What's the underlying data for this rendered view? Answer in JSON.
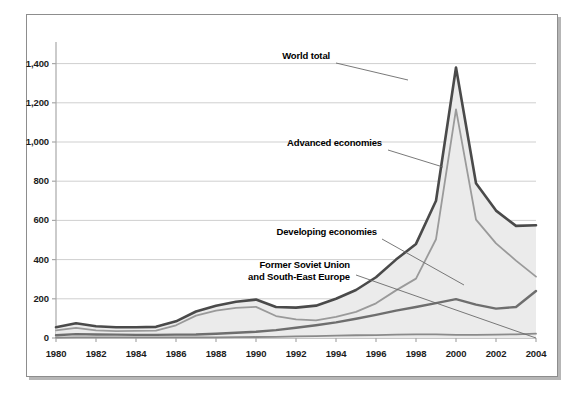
{
  "chart_data": {
    "type": "area",
    "title": "",
    "subtitle": "",
    "xlabel": "",
    "ylabel": "",
    "xlim": [
      1980,
      2004
    ],
    "ylim": [
      0,
      1500
    ],
    "grid": true,
    "legend_position": "inline-annotations",
    "x": [
      1980,
      1981,
      1982,
      1983,
      1984,
      1985,
      1986,
      1987,
      1988,
      1989,
      1990,
      1991,
      1992,
      1993,
      1994,
      1995,
      1996,
      1997,
      1998,
      1999,
      2000,
      2001,
      2002,
      2003,
      2004
    ],
    "y_ticks": [
      0,
      200,
      400,
      600,
      800,
      1000,
      1200,
      1400
    ],
    "y_tick_labels": [
      "0",
      "200",
      "400",
      "600",
      "800",
      "1,000",
      "1,200",
      "1,400"
    ],
    "x_ticks": [
      1980,
      1982,
      1984,
      1986,
      1988,
      1990,
      1992,
      1994,
      1996,
      1998,
      2000,
      2002,
      2004
    ],
    "x_tick_labels": [
      "1980",
      "1982",
      "1984",
      "1986",
      "1988",
      "1990",
      "1992",
      "1994",
      "1996",
      "1998",
      "2000",
      "2002",
      "2004"
    ],
    "series": [
      {
        "name": "World total",
        "values": [
          55,
          75,
          60,
          55,
          55,
          57,
          85,
          135,
          165,
          185,
          196,
          158,
          155,
          165,
          200,
          245,
          310,
          400,
          480,
          700,
          1380,
          790,
          650,
          572,
          575
        ],
        "color": "#4a4a4a",
        "fill": "#ebebeb"
      },
      {
        "name": "Developing economies",
        "values": [
          14,
          20,
          18,
          17,
          16,
          16,
          17,
          18,
          22,
          27,
          32,
          40,
          52,
          65,
          80,
          98,
          118,
          140,
          158,
          178,
          198,
          170,
          150,
          158,
          240
        ],
        "color": "#6e6e6e",
        "fill": "none"
      },
      {
        "name": "Former Soviet Union and South-East Europe",
        "values": [
          2,
          3,
          3,
          3,
          3,
          3,
          3,
          3,
          3,
          4,
          5,
          6,
          8,
          10,
          12,
          14,
          15,
          17,
          19,
          18,
          16,
          16,
          17,
          19,
          22
        ],
        "color": "#8a8a8a",
        "fill": "none"
      },
      {
        "name": "Advanced economies",
        "values": [
          39,
          52,
          39,
          35,
          36,
          38,
          65,
          114,
          140,
          154,
          159,
          112,
          95,
          90,
          108,
          133,
          177,
          243,
          303,
          504,
          1166,
          604,
          483,
          395,
          313
        ],
        "color": "#9a9a9a",
        "fill": "none"
      }
    ],
    "annotations": [
      {
        "id": "world-total",
        "text": "World total",
        "lines": [
          "World total"
        ],
        "label_x": 330,
        "label_y": 56,
        "align": "right",
        "leader": [
          [
            336,
            63
          ],
          [
            408,
            80
          ]
        ]
      },
      {
        "id": "advanced-economies",
        "text": "Advanced economies",
        "lines": [
          "Advanced economies"
        ],
        "label_x": 382,
        "label_y": 143,
        "align": "right",
        "leader": [
          [
            388,
            150
          ],
          [
            443,
            167
          ]
        ]
      },
      {
        "id": "developing-economies",
        "text": "Developing economies",
        "lines": [
          "Developing economies"
        ],
        "label_x": 377,
        "label_y": 232,
        "align": "right",
        "leader": [
          [
            382,
            239
          ],
          [
            464,
            285
          ]
        ]
      },
      {
        "id": "former-soviet-union",
        "text": "Former Soviet Union and South-East Europe",
        "lines": [
          "Former Soviet Union",
          "and South-East Europe"
        ],
        "label_x": 350,
        "label_y": 265,
        "align": "right",
        "leader": [
          [
            356,
            275
          ],
          [
            536,
            338
          ]
        ]
      }
    ]
  },
  "figure": {
    "frame_border_color": "#8d8d8d",
    "shadow_color": "#b6b6b6",
    "background": "#ffffff",
    "gridline_color": "#cfcfcf",
    "axis_color": "#a8a8a8",
    "tick_text_color": "#1c1c1c"
  }
}
